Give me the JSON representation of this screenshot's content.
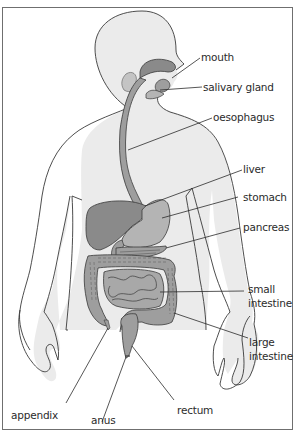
{
  "diagram": {
    "colors": {
      "body_fill": "#ebebeb",
      "outline": "#3a3a3a",
      "organ_dark": "#8a8a8a",
      "organ_mid": "#9e9e9e",
      "organ_light": "#b4b4b4",
      "leader_line": "#2b2b2b",
      "frame": "#6f6f6f"
    },
    "labels": [
      {
        "id": "mouth",
        "text": "mouth"
      },
      {
        "id": "salivary-gland",
        "text": "salivary gland"
      },
      {
        "id": "oesophagus",
        "text": "oesophagus"
      },
      {
        "id": "liver",
        "text": "liver"
      },
      {
        "id": "stomach",
        "text": "stomach"
      },
      {
        "id": "pancreas",
        "text": "pancreas"
      },
      {
        "id": "small-intestine",
        "line1": "small",
        "line2": "intestine"
      },
      {
        "id": "large-intestine",
        "line1": "large",
        "line2": "intestine"
      },
      {
        "id": "appendix",
        "text": "appendix"
      },
      {
        "id": "anus",
        "text": "anus"
      },
      {
        "id": "rectum",
        "text": "rectum"
      }
    ]
  }
}
